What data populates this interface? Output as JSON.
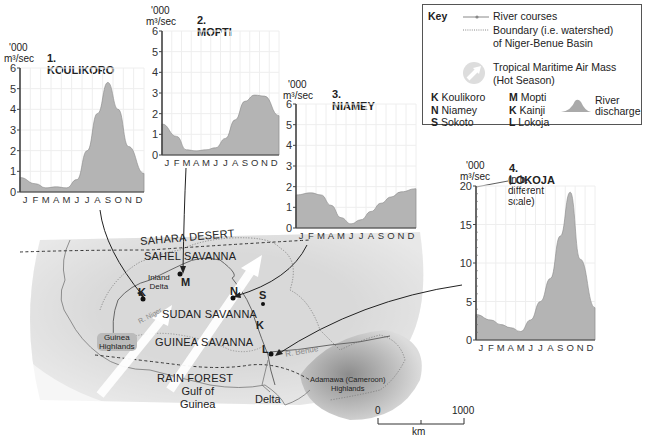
{
  "figure": {
    "key": {
      "title": "Key",
      "river_courses": "River courses",
      "boundary_line1": "Boundary (i.e. watershed)",
      "boundary_line2": "of Niger-Benue Basin",
      "air_mass_line1": "Tropical Maritime Air Mass",
      "air_mass_line2": "(Hot Season)",
      "river_discharge_line1": "River",
      "river_discharge_line2": "discharge",
      "stations": [
        {
          "code": "K",
          "name": "Koulikoro"
        },
        {
          "code": "M",
          "name": "Mopti"
        },
        {
          "code": "N",
          "name": "Niamey"
        },
        {
          "code": "K",
          "name": "Kainji"
        },
        {
          "code": "S",
          "name": "Sokoto"
        },
        {
          "code": "L",
          "name": "Lokoja"
        }
      ]
    },
    "map": {
      "regions": [
        "SAHARA DESERT",
        "SAHEL SAVANNA",
        "SUDAN SAVANNA",
        "GUINEA SAVANNA",
        "RAIN FOREST"
      ],
      "labels": {
        "inland_delta_1": "Inland",
        "inland_delta_2": "Delta",
        "guinea_highlands_1": "Guinea",
        "guinea_highlands_2": "Highlands",
        "gulf_1": "Gulf of",
        "gulf_2": "Guinea",
        "delta": "Delta",
        "adamawa_1": "Adamawa (Cameroon)",
        "adamawa_2": "Highlands",
        "r_niger": "R. Niger",
        "r_benue": "R. Benue"
      },
      "markers": {
        "K1": "K",
        "M": "M",
        "N": "N",
        "S": "S",
        "K2": "K",
        "L": "L"
      },
      "scale": {
        "start": "0",
        "end": "1000",
        "unit": "km"
      }
    }
  },
  "chart_data": [
    {
      "type": "area",
      "title": "1. KOULIKORO",
      "ylabel_line1": "'000",
      "ylabel_line2": "m³/sec",
      "categories": [
        "J",
        "F",
        "M",
        "A",
        "M",
        "J",
        "J",
        "A",
        "S",
        "O",
        "N",
        "D"
      ],
      "values": [
        0.7,
        0.4,
        0.2,
        0.25,
        0.2,
        0.6,
        2.0,
        3.8,
        5.3,
        4.0,
        2.2,
        0.9
      ],
      "yticks": [
        "0",
        "1",
        "2",
        "3",
        "4",
        "5",
        "6"
      ],
      "ylim": [
        0,
        6
      ],
      "grid": true
    },
    {
      "type": "area",
      "title": "2. MOPTI",
      "ylabel_line1": "'000",
      "ylabel_line2": "m³/sec",
      "categories": [
        "J",
        "F",
        "M",
        "A",
        "M",
        "J",
        "J",
        "A",
        "S",
        "O",
        "N",
        "D"
      ],
      "values": [
        1.5,
        0.9,
        0.25,
        0.2,
        0.25,
        0.35,
        0.8,
        1.7,
        2.6,
        2.9,
        2.85,
        1.9
      ],
      "yticks": [
        "0",
        "1",
        "2",
        "3",
        "4",
        "5",
        "6"
      ],
      "ylim": [
        0,
        6
      ],
      "grid": true
    },
    {
      "type": "area",
      "title": "3. NIAMEY",
      "ylabel_line1": "'000",
      "ylabel_line2": "m³/sec",
      "categories": [
        "J",
        "F",
        "M",
        "A",
        "M",
        "J",
        "J",
        "A",
        "S",
        "O",
        "N",
        "D"
      ],
      "values": [
        1.6,
        1.7,
        1.6,
        1.1,
        0.5,
        0.2,
        0.4,
        0.8,
        1.2,
        1.5,
        1.75,
        1.9
      ],
      "yticks": [
        "0",
        "1",
        "2",
        "3",
        "4",
        "5",
        "6"
      ],
      "ylim": [
        0,
        6
      ],
      "grid": true
    },
    {
      "type": "area",
      "title": "4. LOKOJA",
      "subtitle": "(n.b. different scale)",
      "ylabel_line1": "'000",
      "ylabel_line2": "m³/sec",
      "categories": [
        "J",
        "F",
        "M",
        "A",
        "M",
        "J",
        "J",
        "A",
        "S",
        "O",
        "N",
        "D"
      ],
      "values": [
        3.3,
        2.6,
        2.0,
        1.6,
        1.1,
        2.6,
        5.0,
        8.0,
        13.5,
        19.2,
        10.5,
        4.2
      ],
      "yticks": [
        "0",
        "5",
        "10",
        "15",
        "20"
      ],
      "ylim": [
        0,
        20
      ],
      "grid": true
    }
  ]
}
